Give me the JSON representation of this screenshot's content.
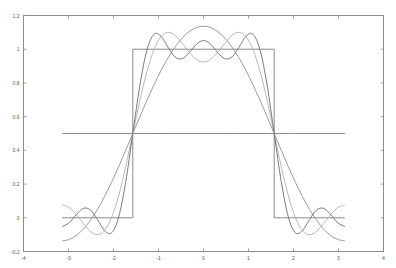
{
  "chart_data": {
    "type": "line",
    "title": "",
    "xlabel": "",
    "ylabel": "",
    "xlim": [
      -4,
      4
    ],
    "ylim": [
      -0.2,
      1.2
    ],
    "xticks": [
      -4,
      -3,
      -2,
      -1,
      0,
      1,
      2,
      3,
      4
    ],
    "yticks": [
      -0.2,
      0,
      0.2,
      0.4,
      0.6,
      0.8,
      1,
      1.2
    ],
    "xtick_labels": [
      "-4",
      "-3",
      "-2",
      "-1",
      "0",
      "1",
      "2",
      "3",
      "4"
    ],
    "ytick_labels": [
      "-0.2",
      "0",
      "0.2",
      "0.4",
      "0.6",
      "0.8",
      "1",
      "1.2"
    ],
    "grid": false,
    "legend": null,
    "x": [
      -3.1416,
      -2.9845,
      -2.8274,
      -2.6704,
      -2.5133,
      -2.3562,
      -2.1991,
      -2.042,
      -1.885,
      -1.7279,
      -1.5708,
      -1.4137,
      -1.2566,
      -1.0996,
      -0.9425,
      -0.7854,
      -0.6283,
      -0.4712,
      -0.3142,
      -0.1571,
      0,
      0.1571,
      0.3142,
      0.4712,
      0.6283,
      0.7854,
      0.9425,
      1.0996,
      1.2566,
      1.4137,
      1.5708,
      1.7279,
      1.885,
      2.042,
      2.1991,
      2.3562,
      2.5133,
      2.6704,
      2.8274,
      2.9845,
      3.1416
    ],
    "series": [
      {
        "name": "square wave",
        "color": "#8a8a8a",
        "points": [
          [
            -3.1416,
            0
          ],
          [
            -1.5708,
            0
          ],
          [
            -1.5708,
            1
          ],
          [
            1.5708,
            1
          ],
          [
            1.5708,
            0
          ],
          [
            3.1416,
            0
          ]
        ]
      },
      {
        "name": "S0 (constant term)",
        "color": "#8a8a8a",
        "values": [
          0.5,
          0.5,
          0.5,
          0.5,
          0.5,
          0.5,
          0.5,
          0.5,
          0.5,
          0.5,
          0.5,
          0.5,
          0.5,
          0.5,
          0.5,
          0.5,
          0.5,
          0.5,
          0.5,
          0.5,
          0.5,
          0.5,
          0.5,
          0.5,
          0.5,
          0.5,
          0.5,
          0.5,
          0.5,
          0.5,
          0.5,
          0.5,
          0.5,
          0.5,
          0.5,
          0.5,
          0.5,
          0.5,
          0.5,
          0.5,
          0.5
        ]
      },
      {
        "name": "S1",
        "color": "#9a9a9a",
        "values": [
          -0.1366,
          -0.1288,
          -0.1055,
          -0.0672,
          -0.015,
          0.0498,
          0.1258,
          0.211,
          0.3033,
          0.4004,
          0.5,
          0.5996,
          0.6967,
          0.789,
          0.8742,
          0.9502,
          1.015,
          1.0672,
          1.1055,
          1.1288,
          1.1366,
          1.1288,
          1.1055,
          1.0672,
          1.015,
          0.9502,
          0.8742,
          0.789,
          0.6967,
          0.5996,
          0.5,
          0.4004,
          0.3033,
          0.211,
          0.1258,
          0.0498,
          -0.015,
          -0.0672,
          -0.1055,
          -0.1288,
          -0.1366
        ]
      },
      {
        "name": "S3",
        "color": "#b8b8b8",
        "values": [
          0.0756,
          0.0603,
          0.0192,
          -0.034,
          -0.0806,
          -0.1002,
          -0.076,
          0.0014,
          0.1316,
          0.304,
          0.5,
          0.696,
          0.8684,
          0.9986,
          1.076,
          1.1002,
          1.0806,
          1.034,
          0.9808,
          0.9397,
          0.9244,
          0.9397,
          0.9808,
          1.034,
          1.0806,
          1.1002,
          1.076,
          0.9986,
          0.8684,
          0.696,
          0.5,
          0.304,
          0.1316,
          0.0014,
          -0.076,
          -0.1002,
          -0.0806,
          -0.034,
          0.0192,
          0.0603,
          0.0756
        ]
      },
      {
        "name": "S5",
        "color": "#7a7a7a",
        "values": [
          -0.0517,
          -0.0297,
          0.0192,
          0.056,
          0.0467,
          -0.0102,
          -0.076,
          -0.0886,
          0.0043,
          0.214,
          0.5,
          0.786,
          0.9957,
          1.0886,
          1.076,
          1.0102,
          0.9533,
          0.944,
          0.9808,
          1.0297,
          1.0517,
          1.0297,
          0.9808,
          0.944,
          0.9533,
          1.0102,
          1.076,
          1.0886,
          0.9957,
          0.786,
          0.5,
          0.214,
          0.0043,
          -0.0886,
          -0.076,
          -0.0102,
          0.0467,
          0.056,
          0.0192,
          -0.0297,
          -0.0517
        ]
      }
    ]
  },
  "colors": {
    "axes": "#8c8c8c",
    "background": "#ffffff"
  }
}
